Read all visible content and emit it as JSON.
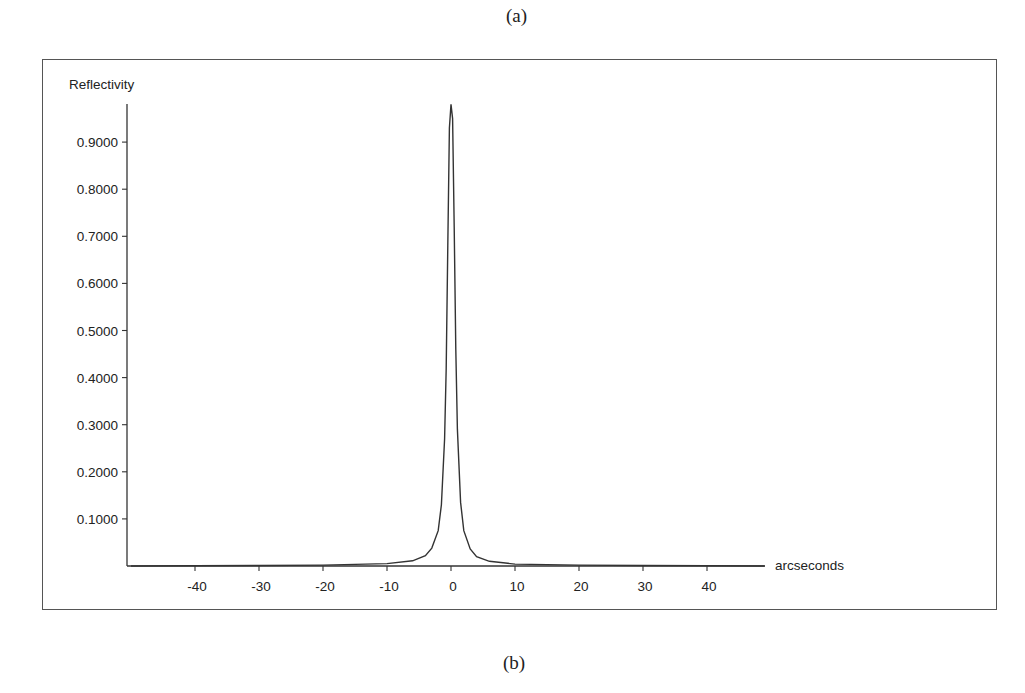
{
  "captions": {
    "top": "(a)",
    "bottom": "(b)"
  },
  "chart_data": {
    "type": "line",
    "title": "",
    "xlabel": "arcseconds",
    "ylabel": "Reflectivity",
    "xlim": [
      -50,
      49
    ],
    "ylim": [
      0,
      1.0
    ],
    "grid": false,
    "legend": null,
    "x_ticks": [
      -40,
      -30,
      -20,
      -10,
      0,
      10,
      20,
      30,
      40
    ],
    "x_tick_labels": [
      "-40",
      "-30",
      "-20",
      "-10",
      "0",
      "10",
      "20",
      "30",
      "40"
    ],
    "y_ticks": [
      0.1,
      0.2,
      0.3,
      0.4,
      0.5,
      0.6,
      0.7,
      0.8,
      0.9
    ],
    "y_tick_labels": [
      "0.1000",
      "0.2000",
      "0.3000",
      "0.4000",
      "0.5000",
      "0.6000",
      "0.7000",
      "0.8000",
      "0.9000"
    ],
    "series": [
      {
        "name": "Reflectivity",
        "color": "#333333",
        "x": [
          -50,
          -40,
          -30,
          -20,
          -10,
          -6,
          -4,
          -3,
          -2,
          -1.5,
          -1,
          -0.75,
          -0.5,
          -0.25,
          0,
          0.25,
          0.5,
          0.75,
          1,
          1.5,
          2,
          3,
          4,
          6,
          10,
          20,
          30,
          40,
          49
        ],
        "y": [
          0.0,
          0.0005,
          0.001,
          0.002,
          0.005,
          0.011,
          0.022,
          0.038,
          0.075,
          0.13,
          0.27,
          0.42,
          0.68,
          0.93,
          0.98,
          0.95,
          0.72,
          0.46,
          0.29,
          0.135,
          0.075,
          0.036,
          0.02,
          0.01,
          0.004,
          0.002,
          0.001,
          0.0005,
          0.0
        ]
      }
    ],
    "peak": {
      "x": 0,
      "y": 0.98
    }
  }
}
